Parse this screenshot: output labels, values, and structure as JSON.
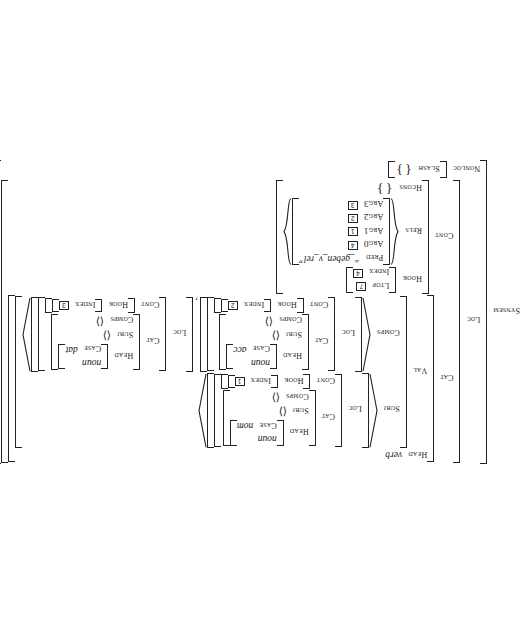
{
  "figure": {
    "type": "hpsg-avm",
    "root_attr": "SYNSEM",
    "rotation_degrees": 180
  },
  "labels": {
    "synsem": "SYNSEM",
    "loc": "LOC",
    "cat": "CAT",
    "head": "HEAD",
    "val": "VAL",
    "subj": "SUBJ",
    "comps": "COMPS",
    "cont": "CONT",
    "hook": "HOOK",
    "ltop": "LTOP",
    "index": "INDEX",
    "rels": "RELS",
    "hcons": "HCONS",
    "nonloc": "NONLOC",
    "slash": "SLASH",
    "case": "CASE",
    "pred": "PRED",
    "arg0": "ARG0",
    "arg1": "ARG1",
    "arg2": "ARG2",
    "arg3": "ARG3"
  },
  "head_value": "verb",
  "subj": {
    "head_type": "noun",
    "case": "nom",
    "subj_list": "⟨ ⟩",
    "comps_list": "⟨ ⟩",
    "index_tag": "1"
  },
  "comps": [
    {
      "head_type": "noun",
      "case": "acc",
      "subj_list": "⟨ ⟩",
      "comps_list": "⟨ ⟩",
      "index_tag": "2"
    },
    {
      "head_type": "noun",
      "case": "dat",
      "subj_list": "⟨ ⟩",
      "comps_list": "⟨ ⟩",
      "index_tag": "3"
    }
  ],
  "comps_separator": ",",
  "cont": {
    "hook": {
      "ltop_tag": "7",
      "index_tag": "4"
    },
    "rels": {
      "pred": "“_geben_v_rel”",
      "arg0_tag": "4",
      "arg1_tag": "1",
      "arg2_tag": "2",
      "arg3_tag": "3"
    },
    "hcons_value": "{ }"
  },
  "nonloc": {
    "slash_value": "{ }"
  }
}
